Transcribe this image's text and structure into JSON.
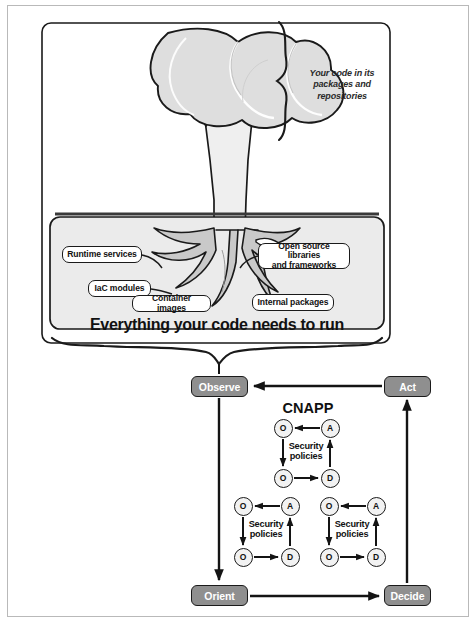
{
  "diagram": {
    "title_annotation": {
      "line1": "Your code in its",
      "line2": "packages and repositories"
    },
    "ground_box": {
      "caption": "Everything your code needs to run",
      "fill_color": "#ebebeb",
      "border_color": "#1a1a1a"
    },
    "root_callouts": [
      {
        "id": "runtime-services",
        "label": "Runtime services",
        "x": 62,
        "y": 246,
        "w": 80,
        "h": 17
      },
      {
        "id": "iac-modules",
        "label": "IaC modules",
        "x": 88,
        "y": 280,
        "w": 63,
        "h": 17
      },
      {
        "id": "container-images",
        "label": "Container images",
        "x": 132,
        "y": 295,
        "w": 79,
        "h": 17
      },
      {
        "id": "open-source-libraries",
        "label": "Open source libraries\nand frameworks",
        "x": 258,
        "y": 243,
        "w": 92,
        "h": 26
      },
      {
        "id": "internal-packages",
        "label": "Internal packages",
        "x": 252,
        "y": 294,
        "w": 82,
        "h": 17
      }
    ],
    "ooda": {
      "cnapp_label": "CNAPP",
      "box_fill": "#8f8f8f",
      "box_text_color": "#ffffff",
      "boxes": [
        {
          "id": "observe",
          "label": "Observe",
          "x": 191,
          "y": 376,
          "w": 57,
          "h": 21
        },
        {
          "id": "act",
          "label": "Act",
          "x": 384,
          "y": 376,
          "w": 47,
          "h": 21
        },
        {
          "id": "orient",
          "label": "Orient",
          "x": 191,
          "y": 585,
          "w": 57,
          "h": 21
        },
        {
          "id": "decide",
          "label": "Decide",
          "x": 384,
          "y": 585,
          "w": 47,
          "h": 21
        }
      ],
      "mini_loops": [
        {
          "id": "cnapp-loop-top",
          "security_policies": "Security\npolicies",
          "nodes": [
            {
              "pos": "top-left",
              "letter": "O",
              "cx": 283,
              "cy": 428
            },
            {
              "pos": "top-right",
              "letter": "A",
              "cx": 330,
              "cy": 428
            },
            {
              "pos": "bottom-left",
              "letter": "O",
              "cx": 283,
              "cy": 478
            },
            {
              "pos": "bottom-right",
              "letter": "D",
              "cx": 330,
              "cy": 478
            }
          ]
        },
        {
          "id": "cnapp-loop-left",
          "security_policies": "Security\npolicies",
          "nodes": [
            {
              "pos": "top-left",
              "letter": "O",
              "cx": 243,
              "cy": 506
            },
            {
              "pos": "top-right",
              "letter": "A",
              "cx": 290,
              "cy": 506
            },
            {
              "pos": "bottom-left",
              "letter": "O",
              "cx": 243,
              "cy": 557
            },
            {
              "pos": "bottom-right",
              "letter": "D",
              "cx": 290,
              "cy": 557
            }
          ]
        },
        {
          "id": "cnapp-loop-right",
          "security_policies": "Security\npolicies",
          "nodes": [
            {
              "pos": "top-left",
              "letter": "O",
              "cx": 329,
              "cy": 506
            },
            {
              "pos": "top-right",
              "letter": "A",
              "cx": 376,
              "cy": 506
            },
            {
              "pos": "bottom-left",
              "letter": "O",
              "cx": 329,
              "cy": 557
            },
            {
              "pos": "bottom-right",
              "letter": "D",
              "cx": 376,
              "cy": 557
            }
          ]
        }
      ]
    },
    "colors": {
      "tree_canopy_fill": "#dedede",
      "tree_trunk_fill": "#efefef",
      "outline": "#1a1a1a",
      "frame": "#b9b9b9",
      "ground_fill": "#ebebeb"
    }
  }
}
